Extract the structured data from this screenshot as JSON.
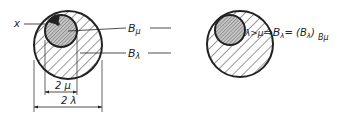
{
  "diagram": {
    "left": {
      "point_label": "x",
      "inner_ball_label": "B",
      "inner_ball_sub": "μ",
      "outer_ball_label": "B",
      "outer_ball_sub": "λ",
      "inner_diameter_label": "2 μ",
      "outer_diameter_label": "2 λ"
    },
    "right": {
      "condition": "λ>μ",
      "arrow": "⇒",
      "result_lhs": "B",
      "result_lhs_sub": "λ",
      "result_eq": "= (B",
      "result_paren_sub": "λ",
      "result_close": ")",
      "result_outer_sub": "Bμ"
    },
    "colors": {
      "stroke": "#222222",
      "hatch": "#333333",
      "inner_fill": "#bbbbbb"
    }
  }
}
